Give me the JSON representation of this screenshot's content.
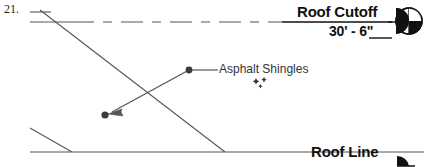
{
  "drawing": {
    "sheet_number": "21.",
    "background_color": "#ffffff",
    "line_color": "#555555",
    "text_color": "#111111",
    "annotation_color": "#333333"
  },
  "levels": [
    {
      "name": "Roof Cutoff",
      "elevation": "30' - 6\"",
      "marker": "level-head-quadrant-icon",
      "line_style": "dash-dot"
    },
    {
      "name": "Roof Line",
      "elevation": "",
      "marker": "level-head-filled-icon",
      "line_style": "solid"
    }
  ],
  "annotations": [
    {
      "label": "Asphalt Shingles",
      "leader_type": "dot-and-arrow",
      "origin_dot": {
        "x": 189,
        "y": 70
      },
      "target_dot": {
        "x": 105,
        "y": 115
      }
    }
  ],
  "cursor": {
    "icon": "sparkle-cursor-icon",
    "x": 252,
    "y": 76
  },
  "geometry": {
    "roof_slope_line": "M 40 10 L 225 152",
    "eave_line": "M 30 128 L 72 152",
    "base_line": "M 30 152 L 424 152",
    "top_short_segment": "M 30 12 L 51 12"
  }
}
